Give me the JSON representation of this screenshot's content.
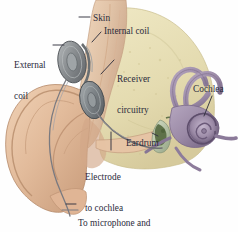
{
  "figure": {
    "background_color": "#fefefe",
    "label_color": "#2b2b3c",
    "width": 238,
    "height": 232
  },
  "labels": {
    "skin": "Skin",
    "internal_coil": "Internal coil",
    "external_coil_line1": "External",
    "external_coil_line2": "coil",
    "receiver_line1": "Receiver",
    "receiver_line2": "circuitry",
    "cochlea": "Cochlea",
    "eardrum": "Eardrum",
    "electrode_line1": "Electrode",
    "electrode_line2": "to cochlea",
    "microphone_line1": "To microphone and",
    "microphone_line2": "sound processor"
  },
  "anatomy": {
    "pinna": {
      "name": "outer-ear-pinna",
      "color": "#e3bd9e"
    },
    "pinna_shadow": {
      "name": "outer-ear-shading",
      "color": "#cfa183"
    },
    "skull_bone": {
      "name": "skull-bone",
      "color": "#e8e0b8"
    },
    "scalp_skin": {
      "name": "scalp-skin-flap",
      "color": "#e0c2a6"
    },
    "cochlea": {
      "name": "cochlea-spiral",
      "color": "#9b8aa6"
    },
    "cochlea_dark": {
      "name": "cochlea-shadow",
      "color": "#6e5d7d"
    },
    "semicircular_canals": {
      "name": "semicircular-canals",
      "color": "#a596b0"
    },
    "external_coil_disc": {
      "name": "external-coil-disc",
      "color": "#8e9295"
    },
    "receiver_disc": {
      "name": "receiver-disc",
      "color": "#7f8488"
    },
    "electrode_wire": {
      "name": "electrode-wire",
      "color": "#6f6f72"
    },
    "eardrum": {
      "name": "eardrum-membrane",
      "color": "#c9d4bb"
    },
    "ossicles": {
      "name": "middle-ear-ossicles",
      "color": "#5f6f57"
    }
  },
  "leader_lines": {
    "color": "#33333f",
    "count": 8
  }
}
